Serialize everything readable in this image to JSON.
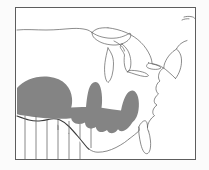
{
  "figure": {
    "type": "map",
    "background_color": "#ffffff",
    "frame_color": "#5d5d5d",
    "has_frame": true,
    "has_axes": false,
    "has_legend": false,
    "has_labels": false,
    "has_scale_bar": false,
    "has_north_arrow": false
  },
  "symbology": {
    "shaded_region": {
      "name": "solid-gray-range",
      "fill_color": "#848484",
      "stroke": "none",
      "description": "Solid gray filled polygon spanning the lower midwest, mid-south and southeastern United States"
    },
    "hatched_region": {
      "name": "vertical-hatch-area",
      "line_color": "#6a6a6a",
      "pattern": "vertical lines",
      "line_count": 6,
      "description": "Vertical hatch lines in the western Gulf coast / Texas area below the shaded range"
    },
    "coastline": {
      "name": "coastline-outline",
      "stroke_color": "#595959",
      "stroke_width": "0.7"
    },
    "lakes": {
      "name": "great-lakes-outline",
      "stroke_color": "#5f5f5f",
      "stroke_width": "0.7",
      "members": [
        "Lake Superior",
        "Lake Michigan",
        "Lake Huron",
        "Lake Erie",
        "Lake Ontario"
      ]
    },
    "national_border": {
      "name": "us-canada-border",
      "stroke_color": "#5a5a5a",
      "stroke_width": "0.7"
    },
    "gulf_coast_emphasis": {
      "name": "gulf-coast-heavy-line",
      "stroke_color": "#3b3b3b",
      "stroke_width": "1.1"
    }
  },
  "geography": {
    "regions_depicted": [
      "Southern Canada",
      "Great Lakes",
      "New England",
      "Atlantic coastal plain",
      "Florida peninsula",
      "Gulf of Mexico coast",
      "Midwest",
      "Great Plains edge"
    ]
  },
  "annotations": [],
  "text_labels": []
}
